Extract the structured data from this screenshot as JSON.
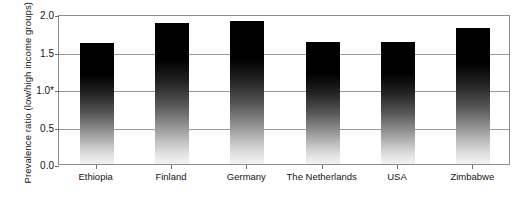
{
  "chart_data": {
    "type": "bar",
    "title": "",
    "xlabel": "",
    "ylabel": "Prevalence ratio (low/high income groups)",
    "ylim": [
      0.0,
      2.0
    ],
    "grid": true,
    "legend": "none",
    "categories": [
      "Ethiopia",
      "Finland",
      "Germany",
      "The Netherlands",
      "USA",
      "Zimbabwe"
    ],
    "values": [
      1.61,
      1.88,
      1.91,
      1.63,
      1.63,
      1.81
    ],
    "ytick_labels": [
      "0.0",
      "0.5",
      "1.0*",
      "1.5",
      "2.0"
    ],
    "ytick_values": [
      0.0,
      0.5,
      1.0,
      1.5,
      2.0
    ],
    "series": [
      {
        "name": "Prevalence ratio",
        "values": [
          1.61,
          1.88,
          1.91,
          1.63,
          1.63,
          1.81
        ]
      }
    ],
    "annotations": [
      {
        "text": "*",
        "attached_to": "1.0",
        "meaning": "reference line marker on the 1.0 tick label"
      }
    ]
  },
  "axis": {
    "y_title": "Prevalence ratio (low/high income groups)",
    "ticks": [
      {
        "label": "2.0",
        "value": 2.0
      },
      {
        "label": "1.5",
        "value": 1.5
      },
      {
        "label": "1.0*",
        "value": 1.0
      },
      {
        "label": "0.5",
        "value": 0.5
      },
      {
        "label": "0.0",
        "value": 0.0
      }
    ]
  },
  "caption": {
    "partial_text": ""
  },
  "colors": {
    "bar_top": "#000000",
    "bar_bottom": "#f2f2f2",
    "gridline": "#9a9a9a",
    "frame": "#8c8c8c",
    "text": "#141414",
    "background": "#ffffff"
  }
}
